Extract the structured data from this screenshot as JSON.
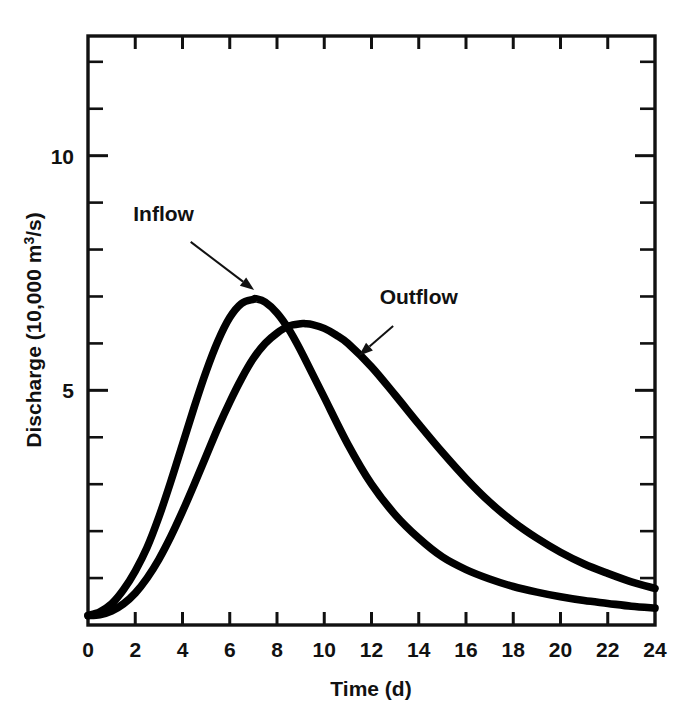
{
  "chart_data": {
    "type": "line",
    "title": "",
    "subtitle": "",
    "xlabel": "Time (d)",
    "ylabel": "Discharge (10,000 m³/s)",
    "ylabel_parts": {
      "prefix": "Discharge (10,000 m",
      "superscript": "3",
      "suffix": "/s)"
    },
    "xlim": [
      0,
      24
    ],
    "ylim": [
      0,
      12.55
    ],
    "grid": false,
    "legend_position": "inline-annotations",
    "x_tick_labels": [
      "0",
      "2",
      "4",
      "6",
      "8",
      "10",
      "12",
      "14",
      "16",
      "18",
      "20",
      "22",
      "24"
    ],
    "x_ticks": [
      0,
      2,
      4,
      6,
      8,
      10,
      12,
      14,
      16,
      18,
      20,
      22,
      24
    ],
    "y_tick_labels": [
      "5",
      "10"
    ],
    "y_ticks_labeled": [
      5,
      10
    ],
    "y_ticks_minor": [
      1,
      2,
      3,
      4,
      6,
      7,
      8,
      9,
      11,
      12
    ],
    "units": {
      "x": "d",
      "y": "10,000 m3/s"
    },
    "series": [
      {
        "name": "Inflow",
        "color": "#000000",
        "peak_x": 7.1,
        "peak_y": 6.95,
        "x": [
          0,
          0.5,
          1,
          1.5,
          2,
          2.5,
          3,
          3.5,
          4,
          4.5,
          5,
          5.5,
          6,
          6.5,
          7,
          7.1,
          7.5,
          8,
          8.5,
          9,
          9.5,
          10,
          11,
          12,
          13,
          14,
          15,
          16,
          17,
          18,
          19,
          20,
          21,
          22,
          23,
          24
        ],
        "y": [
          0.2,
          0.28,
          0.45,
          0.75,
          1.15,
          1.65,
          2.3,
          3.05,
          3.85,
          4.65,
          5.4,
          6.05,
          6.55,
          6.85,
          6.94,
          6.95,
          6.88,
          6.65,
          6.3,
          5.85,
          5.35,
          4.85,
          3.85,
          3.0,
          2.35,
          1.85,
          1.45,
          1.18,
          0.98,
          0.82,
          0.7,
          0.6,
          0.52,
          0.46,
          0.4,
          0.36
        ],
        "annotation": {
          "text": "Inflow",
          "label_x": 3.2,
          "label_y": 8.6,
          "points_to_x": 7.0,
          "points_to_y": 7.15
        }
      },
      {
        "name": "Outflow",
        "color": "#000000",
        "peak_x": 9.2,
        "peak_y": 6.42,
        "x": [
          0,
          0.5,
          1,
          1.5,
          2,
          2.5,
          3,
          3.5,
          4,
          4.5,
          5,
          5.5,
          6,
          6.5,
          7,
          7.5,
          8,
          8.5,
          9,
          9.2,
          9.5,
          10,
          10.5,
          11,
          12,
          13,
          14,
          15,
          16,
          17,
          18,
          19,
          20,
          21,
          22,
          23,
          24
        ],
        "y": [
          0.2,
          0.22,
          0.3,
          0.45,
          0.68,
          1.0,
          1.4,
          1.88,
          2.42,
          3.0,
          3.6,
          4.2,
          4.75,
          5.25,
          5.68,
          6.0,
          6.22,
          6.37,
          6.42,
          6.42,
          6.4,
          6.32,
          6.18,
          6.0,
          5.5,
          4.9,
          4.28,
          3.68,
          3.12,
          2.62,
          2.2,
          1.85,
          1.55,
          1.3,
          1.1,
          0.92,
          0.78
        ],
        "annotation": {
          "text": "Outflow",
          "label_x": 14.0,
          "label_y": 6.85,
          "points_to_x": 11.5,
          "points_to_y": 5.75
        }
      }
    ],
    "annotations": [
      {
        "text": "Inflow",
        "target_series": "Inflow"
      },
      {
        "text": "Outflow",
        "target_series": "Outflow"
      }
    ],
    "colors": {
      "axis": "#111111",
      "curve": "#000000",
      "background": "#ffffff"
    }
  }
}
